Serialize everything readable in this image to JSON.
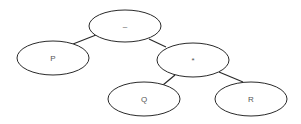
{
  "diagram": {
    "type": "expression-tree",
    "nodes": [
      {
        "id": "minus",
        "label": "–",
        "cx": 125,
        "cy": 26,
        "rx": 36,
        "ry": 16
      },
      {
        "id": "p",
        "label": "P",
        "cx": 53,
        "cy": 58,
        "rx": 36,
        "ry": 17
      },
      {
        "id": "times",
        "label": "*",
        "cx": 193,
        "cy": 60,
        "rx": 36,
        "ry": 17
      },
      {
        "id": "q",
        "label": "Q",
        "cx": 144,
        "cy": 99,
        "rx": 36,
        "ry": 17
      },
      {
        "id": "r",
        "label": "R",
        "cx": 251,
        "cy": 99,
        "rx": 36,
        "ry": 17
      }
    ],
    "edges": [
      {
        "from": "minus",
        "to": "p",
        "x1": 96,
        "y1": 35,
        "x2": 73,
        "y2": 44
      },
      {
        "from": "minus",
        "to": "times",
        "x1": 149,
        "y1": 39,
        "x2": 166,
        "y2": 47
      },
      {
        "from": "times",
        "to": "q",
        "x1": 175,
        "y1": 75,
        "x2": 163,
        "y2": 85
      },
      {
        "from": "times",
        "to": "r",
        "x1": 219,
        "y1": 72,
        "x2": 243,
        "y2": 82
      }
    ]
  }
}
